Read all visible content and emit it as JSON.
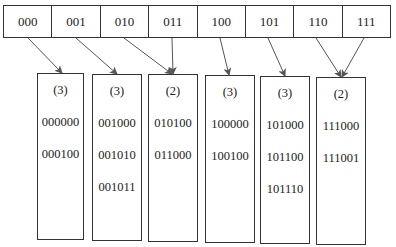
{
  "directory": {
    "global_depth": 3,
    "cells": [
      {
        "label": "000",
        "bucket": 0
      },
      {
        "label": "001",
        "bucket": 1
      },
      {
        "label": "010",
        "bucket": 2
      },
      {
        "label": "011",
        "bucket": 2
      },
      {
        "label": "100",
        "bucket": 3
      },
      {
        "label": "101",
        "bucket": 4
      },
      {
        "label": "110",
        "bucket": 5
      },
      {
        "label": "111",
        "bucket": 5
      }
    ]
  },
  "buckets": [
    {
      "depth_label": "(3)",
      "keys": [
        "000000",
        "000100"
      ]
    },
    {
      "depth_label": "(3)",
      "keys": [
        "001000",
        "001010",
        "001011"
      ]
    },
    {
      "depth_label": "(2)",
      "keys": [
        "010100",
        "011000"
      ]
    },
    {
      "depth_label": "(3)",
      "keys": [
        "100000",
        "100100"
      ]
    },
    {
      "depth_label": "(3)",
      "keys": [
        "101000",
        "101100",
        "101110"
      ]
    },
    {
      "depth_label": "(2)",
      "keys": [
        "111000",
        "111001"
      ]
    }
  ],
  "colors": {
    "line": "#333333",
    "arrow": "#555555",
    "background": "#ffffff"
  }
}
